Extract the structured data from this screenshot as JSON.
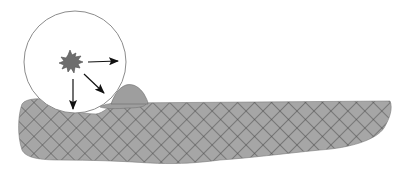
{
  "diagram": {
    "type": "illustration",
    "colors": {
      "background": "#ffffff",
      "substrate_fill": "#a6a6a6",
      "hatch_line": "#4a4a4a",
      "mound_fill": "#9e9e9e",
      "particle_fill": "#6e6e6e",
      "circle_stroke": "#8c8c8c",
      "arrow": "#111111"
    },
    "elements": [
      {
        "name": "magnifier-circle",
        "shape": "circle"
      },
      {
        "name": "particle",
        "shape": "irregular-star"
      },
      {
        "name": "arrow-right",
        "direction": "right"
      },
      {
        "name": "arrow-down",
        "direction": "down"
      },
      {
        "name": "arrow-down-right",
        "direction": "down-right"
      },
      {
        "name": "deposit-mound",
        "shape": "dome"
      },
      {
        "name": "substrate-band",
        "shape": "cross-hatched elongated slab"
      }
    ]
  }
}
